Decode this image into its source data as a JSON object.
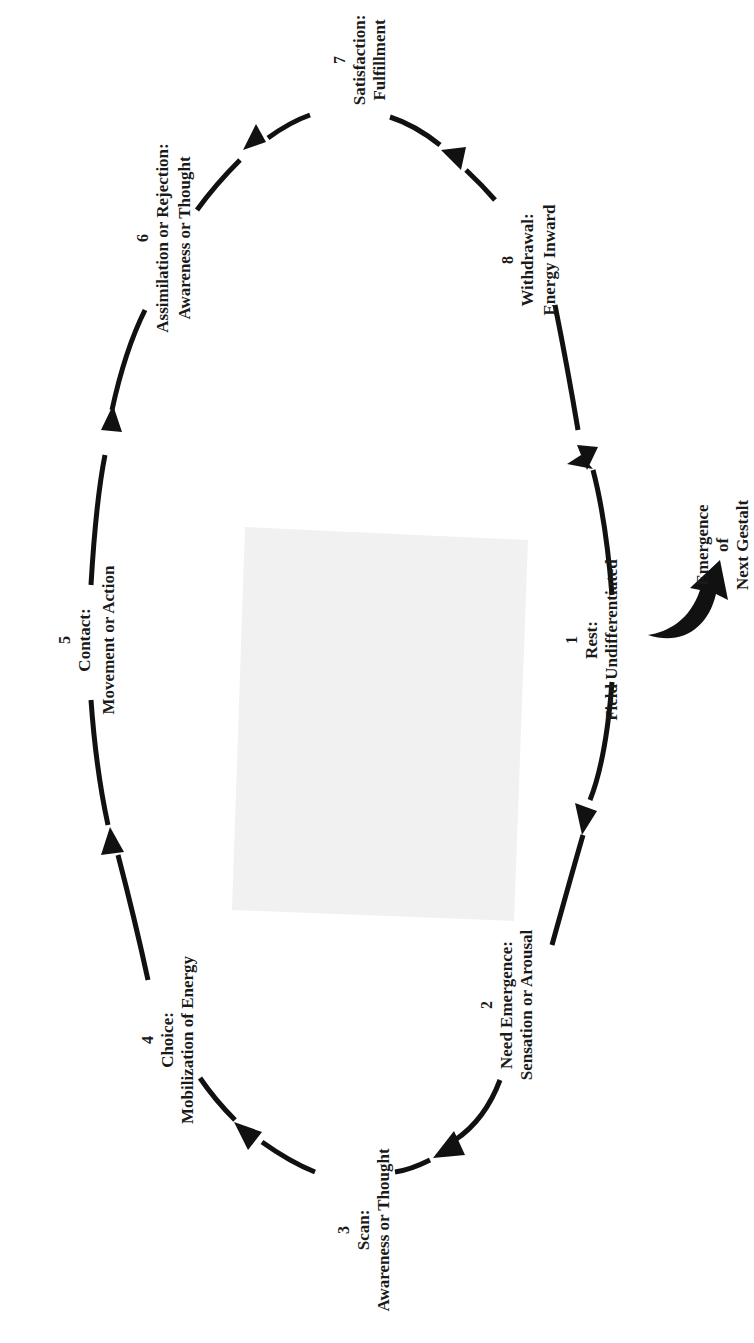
{
  "diagram": {
    "orientation": "rotated -90deg (text reads bottom-to-top)",
    "colors": {
      "ink": "#111111",
      "placeholder_fill": "#f1f1f1",
      "background": "#ffffff"
    },
    "stages": [
      {
        "number": "1",
        "title": "Rest:",
        "subtitle": "Field Undifferentiated"
      },
      {
        "number": "2",
        "title": "Need Emergence:",
        "subtitle": "Sensation or Arousal"
      },
      {
        "number": "3",
        "title": "Scan:",
        "subtitle": "Awareness or Thought"
      },
      {
        "number": "4",
        "title": "Choice:",
        "subtitle": "Mobilization of Energy"
      },
      {
        "number": "5",
        "title": "Contact:",
        "subtitle": "Movement or Action"
      },
      {
        "number": "6",
        "title": "Assimilation or Rejection:",
        "subtitle": "Awareness or Thought"
      },
      {
        "number": "7",
        "title": "Satisfaction:",
        "subtitle": "Fulfillment"
      },
      {
        "number": "8",
        "title": "Withdrawal:",
        "subtitle": "Energy Inward"
      }
    ],
    "emergence": {
      "line1": "Emergence",
      "line2": "of",
      "line3": "Next Gestalt"
    },
    "center_placeholder": "blank gray rectangle"
  }
}
